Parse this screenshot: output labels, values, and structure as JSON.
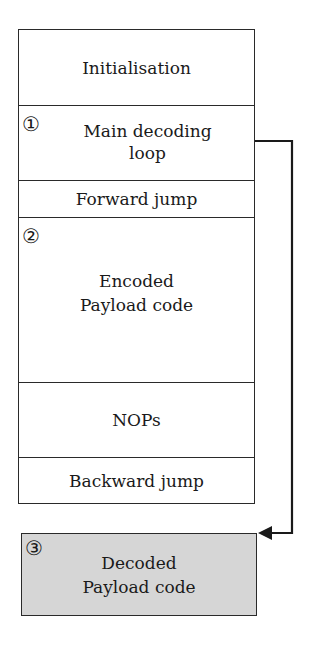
{
  "diagram": {
    "blocks": [
      {
        "id": "initialisation",
        "label": "Initialisation",
        "badge": ""
      },
      {
        "id": "main-decoding-loop",
        "label_line1": "Main decoding",
        "label_line2": "loop",
        "badge": "①"
      },
      {
        "id": "forward-jump",
        "label": "Forward jump",
        "badge": ""
      },
      {
        "id": "encoded-payload",
        "label_line1": "Encoded",
        "label_line2": "Payload code",
        "badge": "②"
      },
      {
        "id": "nops",
        "label": "NOPs",
        "badge": ""
      },
      {
        "id": "backward-jump",
        "label": "Backward jump",
        "badge": ""
      }
    ],
    "decoded": {
      "label_line1": "Decoded",
      "label_line2": "Payload code",
      "badge": "③",
      "fill": "#d6d6d6"
    },
    "arrow": {
      "from": "main-decoding-loop",
      "to": "decoded",
      "color": "#1a1a1a"
    }
  }
}
